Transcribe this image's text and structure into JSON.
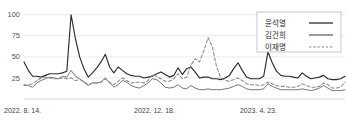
{
  "chart_data": {
    "type": "line",
    "title": "",
    "xlabel": "",
    "ylabel": "",
    "ylim": [
      0,
      108
    ],
    "yticks": [
      25,
      50,
      75,
      100
    ],
    "ytick_labels": [
      "25",
      "50",
      "75",
      "100"
    ],
    "xtick_labels": [
      "2022. 8. 14.",
      "2022. 12. 18.",
      "2023. 4. 23."
    ],
    "xtick_positions": [
      0,
      0.405,
      0.735
    ],
    "grid": true,
    "legend_position": "top-right",
    "legend": [
      "윤석열",
      "김건희",
      "이재명"
    ],
    "x": [
      0,
      1,
      2,
      3,
      4,
      5,
      6,
      7,
      8,
      9,
      10,
      11,
      12,
      13,
      14,
      15,
      16,
      17,
      18,
      19,
      20,
      21,
      22,
      23,
      24,
      25,
      26,
      27,
      28,
      29,
      30,
      31,
      32,
      33,
      34,
      35,
      36,
      37,
      38,
      39,
      40,
      41,
      42,
      43,
      44,
      45,
      46,
      47,
      48,
      49,
      50,
      51,
      52,
      53,
      54,
      55,
      56,
      57,
      58,
      59,
      60,
      61,
      62,
      63,
      64,
      65,
      66,
      67,
      68,
      69,
      70,
      71,
      72,
      73,
      74,
      75
    ],
    "series": [
      {
        "name": "윤석열",
        "style": "solid",
        "color": "#2b2b2b",
        "values": [
          44,
          34,
          27,
          27,
          26,
          28,
          30,
          30,
          30,
          31,
          33,
          100,
          72,
          50,
          36,
          26,
          31,
          37,
          44,
          53,
          38,
          31,
          38,
          34,
          30,
          28,
          27,
          27,
          25,
          26,
          27,
          30,
          32,
          29,
          26,
          28,
          37,
          29,
          36,
          38,
          32,
          25,
          26,
          26,
          24,
          24,
          23,
          25,
          28,
          36,
          43,
          34,
          26,
          24,
          24,
          24,
          27,
          56,
          43,
          33,
          28,
          27,
          27,
          26,
          25,
          31,
          27,
          24,
          25,
          26,
          28,
          24,
          23,
          23,
          24,
          27
        ]
      },
      {
        "name": "김건희",
        "style": "solid",
        "color": "#6e6e73",
        "values": [
          17,
          16,
          14,
          19,
          22,
          24,
          26,
          25,
          24,
          27,
          26,
          34,
          27,
          24,
          20,
          16,
          19,
          19,
          20,
          25,
          19,
          14,
          17,
          22,
          20,
          16,
          14,
          13,
          16,
          19,
          24,
          23,
          19,
          14,
          13,
          14,
          17,
          13,
          12,
          16,
          13,
          11,
          11,
          12,
          11,
          11,
          11,
          12,
          13,
          15,
          17,
          15,
          12,
          11,
          11,
          11,
          12,
          18,
          15,
          13,
          11,
          11,
          11,
          11,
          11,
          12,
          11,
          10,
          11,
          13,
          16,
          13,
          10,
          10,
          10,
          11
        ]
      },
      {
        "name": "이재명",
        "style": "dashed",
        "color": "#8a8a8f",
        "values": [
          16,
          17,
          18,
          22,
          25,
          26,
          25,
          24,
          24,
          25,
          24,
          25,
          22,
          23,
          21,
          17,
          19,
          19,
          20,
          24,
          20,
          17,
          21,
          25,
          22,
          19,
          20,
          20,
          19,
          22,
          29,
          27,
          24,
          21,
          21,
          24,
          30,
          24,
          26,
          40,
          48,
          44,
          57,
          73,
          62,
          38,
          25,
          22,
          21,
          23,
          25,
          22,
          18,
          17,
          17,
          16,
          17,
          20,
          18,
          16,
          15,
          15,
          14,
          14,
          15,
          18,
          16,
          14,
          14,
          15,
          19,
          17,
          13,
          13,
          14,
          20
        ]
      }
    ]
  }
}
